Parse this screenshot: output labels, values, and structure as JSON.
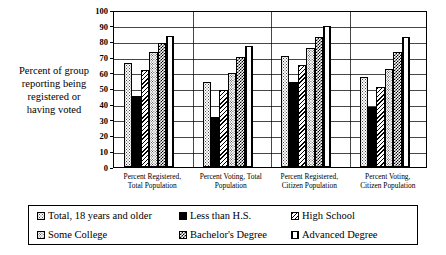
{
  "chart_data": {
    "type": "bar",
    "title": "",
    "subtitle": "",
    "xlabel": "",
    "ylabel": "Percent of group reporting being registered or having voted",
    "ylabel_lines": [
      "Percent of group",
      "reporting being",
      "registered or",
      "having voted"
    ],
    "ylim": [
      0,
      100
    ],
    "ytick_step": 10,
    "yticks": [
      "0",
      "10",
      "20",
      "30",
      "40",
      "50",
      "60",
      "70",
      "80",
      "90",
      "100"
    ],
    "grid": true,
    "legend_position": "bottom",
    "categories": [
      "Percent Registered, Total Population",
      "Percent Voting, Total Population",
      "Percent Registered, Citizen Population",
      "Percent Voting, Citizen Population"
    ],
    "category_lines": [
      [
        "Percent Registered,",
        "Total Population"
      ],
      [
        "Percent Voting, Total",
        "Population"
      ],
      [
        "Percent Registered,",
        "Citizen Population"
      ],
      [
        "Percent Voting,",
        "Citizen Population"
      ]
    ],
    "series": [
      {
        "name": "Total, 18 years and older",
        "pattern": "light-dots",
        "values": [
          66.0,
          54.0,
          70.5,
          57.5
        ]
      },
      {
        "name": "Less than H.S.",
        "pattern": "solid-black",
        "values": [
          45.0,
          32.0,
          54.0,
          38.5
        ]
      },
      {
        "name": "High School",
        "pattern": "diagonal-hatch",
        "values": [
          62.0,
          49.0,
          65.0,
          51.0
        ]
      },
      {
        "name": "Some College",
        "pattern": "medium-dots",
        "values": [
          73.0,
          60.0,
          75.5,
          62.5
        ]
      },
      {
        "name": "Bachelor's Degree",
        "pattern": "checkerboard",
        "values": [
          79.0,
          70.0,
          83.0,
          73.0
        ]
      },
      {
        "name": "Advanced Degree",
        "pattern": "vertical-stripes",
        "values": [
          83.5,
          77.0,
          90.0,
          82.5
        ]
      }
    ]
  },
  "legend": {
    "entries": [
      {
        "label": "Total, 18 years and older",
        "pattern": "light-dots"
      },
      {
        "label": "Less than H.S.",
        "pattern": "solid-black"
      },
      {
        "label": "High School",
        "pattern": "diagonal-hatch"
      },
      {
        "label": "Some College",
        "pattern": "medium-dots"
      },
      {
        "label": "Bachelor's Degree",
        "pattern": "checkerboard"
      },
      {
        "label": "Advanced Degree",
        "pattern": "vertical-stripes"
      }
    ]
  },
  "colors": {
    "axis": "#000000",
    "grid": "#000000",
    "background": "#ffffff",
    "ink": "#000000"
  }
}
